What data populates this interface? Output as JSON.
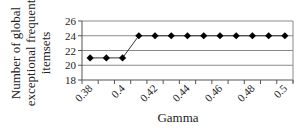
{
  "chart_data": {
    "type": "line",
    "title": "",
    "xlabel": "Gamma",
    "ylabel": "Number of global exceptional frequent itemsets",
    "ylabel_lines": [
      "Number of global",
      "exceptional frequent",
      "itemsets"
    ],
    "categories": [
      "0.38",
      "0.39",
      "0.4",
      "0.41",
      "0.42",
      "0.43",
      "0.44",
      "0.45",
      "0.46",
      "0.47",
      "0.48",
      "0.49",
      "0.5"
    ],
    "x_tick_labels_shown": [
      "0.38",
      "0.4",
      "0.42",
      "0.44",
      "0.46",
      "0.48",
      "0.5"
    ],
    "series": [
      {
        "name": "Number of global exceptional frequent itemsets",
        "values": [
          21,
          21,
          21,
          24,
          24,
          24,
          24,
          24,
          24,
          24,
          24,
          24,
          24
        ],
        "marker": "diamond",
        "color": "#000000"
      }
    ],
    "ylim": [
      18,
      26
    ],
    "yticks": [
      18,
      20,
      22,
      24,
      26
    ],
    "grid": {
      "horizontal": true,
      "vertical": false
    },
    "legend": "none",
    "x_tick_rotation": -45
  }
}
